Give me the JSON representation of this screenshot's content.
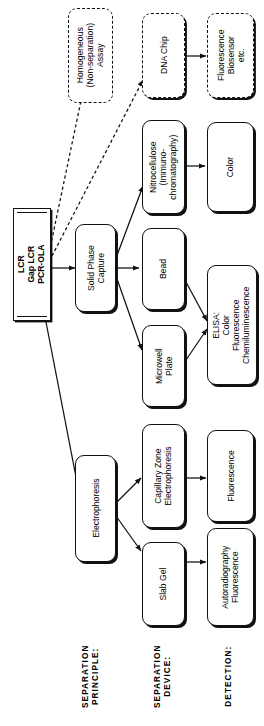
{
  "diagram": {
    "orientation": "rotated-90-ccw",
    "colors": {
      "ink": "#111111",
      "paper": "#ffffff"
    },
    "captions": [
      {
        "id": "sep-principle",
        "label": "SEPARATION\nPRINCIPLE:"
      },
      {
        "id": "sep-device",
        "label": "SEPARATION\nDEVICE:"
      },
      {
        "id": "detection",
        "label": "DETECTION:"
      }
    ],
    "nodes": {
      "start": {
        "label": "LCR\nGap LCR\nPCR-OLA",
        "style": "double-rect"
      },
      "homogeneous": {
        "label": "Homogeneous\n(Non-separation)\nAssay",
        "style": "dashed"
      },
      "dna_chip": {
        "label": "DNA Chip",
        "style": "dashed-shadow"
      },
      "fluor_biosensor": {
        "label": "Fluorescence\nBiosensor\netc.",
        "style": "dashed-shadow"
      },
      "nitrocellulose": {
        "label": "Nitrocellulose\n(Immuno-\nchromatography)",
        "style": "solid"
      },
      "color": {
        "label": "Color",
        "style": "solid"
      },
      "solid_phase": {
        "label": "Solid Phase\nCapture",
        "style": "solid"
      },
      "bead": {
        "label": "Bead",
        "style": "solid"
      },
      "microwell": {
        "label": "Microwell\nPlate",
        "style": "solid"
      },
      "elisa": {
        "label": "ELISA:\nColor\nFluorescence\nChemiluminescence",
        "style": "solid"
      },
      "electrophoresis": {
        "label": "Electrophoresis",
        "style": "solid"
      },
      "cze": {
        "label": "Capillary Zone\nElectrophoresis",
        "style": "solid"
      },
      "fluorescence": {
        "label": "Fluorescence",
        "style": "solid"
      },
      "slab_gel": {
        "label": "Slab Gel",
        "style": "solid"
      },
      "autoradiography": {
        "label": "Autoradiography\nFluorescence",
        "style": "solid"
      }
    },
    "edges": [
      {
        "from": "start",
        "to": "solid_phase",
        "style": "solid"
      },
      {
        "from": "start",
        "to": "electrophoresis",
        "style": "solid"
      },
      {
        "from": "start",
        "to": "homogeneous",
        "style": "dashed"
      },
      {
        "from": "start",
        "to": "dna_chip",
        "style": "dashed"
      },
      {
        "from": "solid_phase",
        "to": "nitrocellulose",
        "style": "solid"
      },
      {
        "from": "solid_phase",
        "to": "bead",
        "style": "solid"
      },
      {
        "from": "solid_phase",
        "to": "microwell",
        "style": "solid"
      },
      {
        "from": "nitrocellulose",
        "to": "color",
        "style": "solid"
      },
      {
        "from": "bead",
        "to": "elisa",
        "style": "solid"
      },
      {
        "from": "microwell",
        "to": "elisa",
        "style": "solid"
      },
      {
        "from": "dna_chip",
        "to": "fluor_biosensor",
        "style": "solid"
      },
      {
        "from": "electrophoresis",
        "to": "cze",
        "style": "solid"
      },
      {
        "from": "electrophoresis",
        "to": "slab_gel",
        "style": "solid"
      },
      {
        "from": "cze",
        "to": "fluorescence",
        "style": "solid"
      },
      {
        "from": "slab_gel",
        "to": "autoradiography",
        "style": "solid"
      }
    ]
  }
}
